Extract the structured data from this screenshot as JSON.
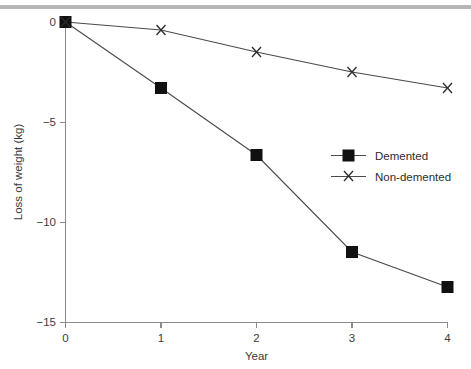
{
  "figure": {
    "background_color": "#ffffff",
    "top_rule_color": "#b6b6b8",
    "line_color": "#4a4a4c",
    "marker_color": "#111113",
    "axis_color": "#8a8a8c"
  },
  "chart_data": {
    "type": "line",
    "title": "",
    "subtitle": "",
    "xlabel": "Year",
    "ylabel": "Loss of weight (kg)",
    "x": [
      0,
      1,
      2,
      3,
      4
    ],
    "xticklabels": [
      "0",
      "1",
      "2",
      "3",
      "4"
    ],
    "yticks": [
      0,
      -5,
      -10,
      -15
    ],
    "yticklabels": [
      "0",
      "−5",
      "−10",
      "−15"
    ],
    "xlim": [
      0,
      4
    ],
    "ylim": [
      -15,
      0
    ],
    "grid": false,
    "legend_position": "center-right",
    "series": [
      {
        "name": "Demented",
        "marker": "filled-square",
        "values": [
          0,
          -3.3,
          -6.65,
          -11.5,
          -13.25
        ]
      },
      {
        "name": "Non-demented",
        "marker": "cross",
        "values": [
          0,
          -0.4,
          -1.5,
          -2.5,
          -3.3
        ]
      }
    ]
  },
  "legend": {
    "entries": [
      {
        "label": "Demented",
        "marker": "filled-square"
      },
      {
        "label": "Non-demented",
        "marker": "cross"
      }
    ]
  }
}
